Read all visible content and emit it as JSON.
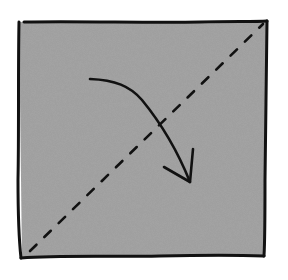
{
  "diagram": {
    "colors": {
      "background": "#ffffff",
      "paper_fill": "#a6a6a6",
      "ink": "#111111"
    },
    "square": {
      "corners": {
        "top_left": [
          18,
          22
        ],
        "top_right": [
          267,
          22
        ],
        "bottom_right": [
          264,
          256
        ],
        "bottom_left": [
          20,
          258
        ]
      }
    },
    "fold_line": {
      "style": "dashed",
      "from": [
        30,
        252
      ],
      "to": [
        264,
        24
      ]
    },
    "arrow": {
      "style": "curved",
      "start": [
        90,
        79
      ],
      "end": [
        188,
        183
      ],
      "icon": "fold-arrow-icon"
    }
  }
}
